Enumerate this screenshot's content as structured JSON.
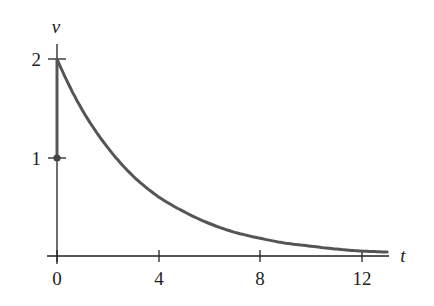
{
  "chart_data": {
    "type": "line",
    "title": "",
    "xlabel": "t",
    "ylabel": "v",
    "xlim": [
      0,
      13
    ],
    "ylim": [
      0,
      2
    ],
    "xticks": [
      0,
      4,
      8,
      12
    ],
    "xtick_labels": [
      "0",
      "4",
      "8",
      "12"
    ],
    "yticks": [
      1,
      2
    ],
    "ytick_labels": [
      "1",
      "2"
    ],
    "grid": false,
    "legend": null,
    "series": [
      {
        "name": "v(t)",
        "description": "Exponential decay starting at v=2, approx v = 2e^(-0.3t)",
        "x": [
          0,
          1,
          2,
          3,
          4,
          5,
          6,
          7,
          8,
          9,
          10,
          11,
          12,
          13
        ],
        "y": [
          2.0,
          1.48,
          1.1,
          0.81,
          0.6,
          0.45,
          0.33,
          0.24,
          0.18,
          0.13,
          0.1,
          0.07,
          0.05,
          0.04
        ],
        "color": "#555555"
      },
      {
        "name": "jump",
        "description": "Vertical segment at t=0 from v=1 to v=2",
        "x": [
          0,
          0
        ],
        "y": [
          1,
          2
        ],
        "color": "#555555"
      }
    ],
    "annotations": [
      {
        "type": "point",
        "x": 0,
        "y": 1,
        "description": "filled dot at (0,1)"
      }
    ],
    "colors": {
      "curve": "#555555",
      "axes": "#222222"
    }
  },
  "labels": {
    "x_axis": "t",
    "y_axis": "v",
    "xticks": [
      "0",
      "4",
      "8",
      "12"
    ],
    "yticks": [
      "1",
      "2"
    ]
  }
}
